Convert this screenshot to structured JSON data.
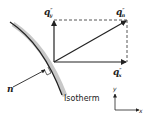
{
  "diagram": {
    "labels": {
      "qy": "q",
      "qy_sup": "″",
      "qy_sub": "y",
      "qn": "q",
      "qn_sup": "″",
      "qn_sub": "n",
      "qx": "q",
      "qx_sup": "″",
      "qx_sub": "x",
      "normal": "n",
      "isotherm": "Isotherm",
      "axis_y": "y",
      "axis_x": "x"
    },
    "colors": {
      "line": "#222222",
      "shade": "#c8c8c8",
      "dash": "#444444"
    }
  }
}
